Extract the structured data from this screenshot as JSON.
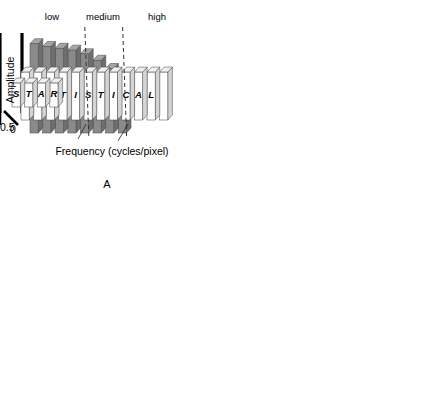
{
  "figure": {
    "axis": {
      "x_label": "Frequency (cycles/pixel)",
      "y_label": "Amplitude",
      "x_min_tick": "0",
      "x_max_tick": "0.5"
    },
    "bands": [
      {
        "label": "low"
      },
      {
        "label": "medium"
      },
      {
        "label": "high"
      }
    ],
    "colors": {
      "signal_bar": "#8a8a8a",
      "signal_bar_side": "#6e6e6e",
      "signal_bar_top": "#a5a5a5",
      "noise_bar": "#ffffff",
      "noise_bar_side": "#d5d5d5",
      "noise_bar_top": "#f0f0f0",
      "envelope": "#d9d9d9",
      "envelope_stroke": "#6f6f6f",
      "axis": "#000000"
    },
    "panels": [
      {
        "id": "A",
        "letter": "A",
        "annotation": "",
        "row_back_word": "SIGNAL",
        "row_mid_word": "STATISTICAL",
        "row_front_word": "STAR",
        "show_bands": true,
        "show_axis_titles": true
      },
      {
        "id": "B",
        "letter": "B",
        "annotation": "ramp filter",
        "row_back_word": "SIGNAL",
        "row_mid_word": "NOISE",
        "row_front_word": "",
        "show_bands": false,
        "show_axis_titles": false
      },
      {
        "id": "C",
        "letter": "C",
        "annotation": "low pass filter",
        "row_back_word": "SIGNAL",
        "row_mid_word": "NOISE",
        "row_front_word": "STAR",
        "show_bands": false,
        "show_axis_titles": false
      },
      {
        "id": "D",
        "letter": "D",
        "annotation": "combination filter",
        "row_back_word": "SIGNAL",
        "row_mid_word": "NOISE",
        "row_front_word": "",
        "show_bands": false,
        "show_axis_titles": false
      }
    ]
  },
  "chart_data": {
    "type": "bar",
    "xlabel": "Frequency (cycles/pixel)",
    "ylabel": "Amplitude",
    "xlim": [
      0,
      0.5
    ],
    "ylim": [
      0,
      1
    ],
    "grid": false,
    "legend": false,
    "n_bins": 12,
    "bin_labels": [
      "S",
      "T",
      "A",
      "T",
      "I",
      "S",
      "T",
      "I",
      "C",
      "A",
      "L",
      ""
    ],
    "bands": {
      "low": [
        0,
        0.17
      ],
      "medium": [
        0.17,
        0.29
      ],
      "high": [
        0.29,
        0.5
      ]
    },
    "panels": [
      {
        "id": "A",
        "annotation": "",
        "filter_shape": "none",
        "filter_gain": [
          1,
          1,
          1,
          1,
          1,
          1,
          1,
          1,
          1,
          1,
          1,
          1
        ],
        "series": [
          {
            "name": "SIGNAL",
            "letters": [
              "",
              "S",
              "I",
              "G",
              "N",
              "A",
              "L",
              "",
              "",
              "",
              "",
              ""
            ],
            "values": [
              0.97,
              0.94,
              0.92,
              0.9,
              0.86,
              0.79,
              0.7,
              0.56,
              0,
              0,
              0,
              0
            ]
          },
          {
            "name": "STATISTICAL",
            "letters": [
              "S",
              "T",
              "A",
              "T",
              "I",
              "S",
              "T",
              "I",
              "C",
              "A",
              "L",
              ""
            ],
            "values": [
              0.52,
              0.52,
              0.52,
              0.52,
              0.52,
              0.52,
              0.52,
              0.52,
              0.52,
              0.52,
              0.52,
              0.52
            ]
          },
          {
            "name": "STAR",
            "letters": [
              "S",
              "T",
              "A",
              "R",
              "",
              "",
              "",
              "",
              "",
              "",
              "",
              ""
            ],
            "values": [
              0.26,
              0.26,
              0.26,
              0.26,
              0,
              0,
              0,
              0,
              0,
              0,
              0,
              0
            ]
          }
        ]
      },
      {
        "id": "B",
        "annotation": "ramp filter",
        "filter_shape": "ramp",
        "filter_gain": [
          0.05,
          0.14,
          0.23,
          0.32,
          0.41,
          0.5,
          0.59,
          0.68,
          0.77,
          0.86,
          0.93,
          1.0
        ],
        "series": [
          {
            "name": "SIGNAL",
            "letters": [
              "",
              "S",
              "I",
              "G",
              "N",
              "A",
              "L",
              "",
              "",
              "",
              "",
              ""
            ],
            "values": [
              0.05,
              0.13,
              0.21,
              0.29,
              0.35,
              0.4,
              0.41,
              0.38,
              0,
              0,
              0,
              0
            ]
          },
          {
            "name": "NOISE",
            "letters": [
              "",
              "N",
              "O",
              "I",
              "S",
              "E",
              "",
              "",
              "",
              "",
              "",
              ""
            ],
            "values": [
              0.03,
              0.07,
              0.12,
              0.17,
              0.21,
              0.26,
              0.31,
              0.35,
              0.4,
              0.44,
              0.48,
              0.52
            ]
          },
          {
            "name": "STAR",
            "letters": [
              "",
              "",
              "",
              "",
              "",
              "",
              "",
              "",
              "",
              "",
              "",
              ""
            ],
            "values": [
              0,
              0,
              0,
              0,
              0,
              0,
              0,
              0,
              0,
              0,
              0,
              0
            ]
          }
        ]
      },
      {
        "id": "C",
        "annotation": "low pass filter",
        "filter_shape": "lowpass",
        "filter_gain": [
          1.0,
          1.0,
          1.0,
          1.0,
          1.0,
          1.0,
          0.88,
          0.74,
          0.6,
          0.45,
          0.3,
          0.16
        ],
        "series": [
          {
            "name": "SIGNAL",
            "letters": [
              "S",
              "I",
              "G",
              "M",
              "A",
              "L",
              "",
              "",
              "",
              "",
              "",
              ""
            ],
            "values": [
              0.97,
              0.94,
              0.92,
              0.9,
              0.86,
              0.79,
              0.62,
              0.47,
              0,
              0,
              0,
              0
            ]
          },
          {
            "name": "NOISE",
            "letters": [
              "",
              "",
              "N",
              "O",
              "I",
              "S",
              "E",
              "",
              "",
              "",
              "",
              ""
            ],
            "values": [
              0.52,
              0.52,
              0.52,
              0.52,
              0.52,
              0.52,
              0.5,
              0.42,
              0.34,
              0.26,
              0.19,
              0.12
            ]
          },
          {
            "name": "STAR",
            "letters": [
              "S",
              "T",
              "A",
              "R",
              "",
              "",
              "",
              "",
              "",
              "",
              "",
              ""
            ],
            "values": [
              0.26,
              0.26,
              0.26,
              0.26,
              0,
              0,
              0,
              0,
              0,
              0,
              0,
              0
            ]
          }
        ]
      },
      {
        "id": "D",
        "annotation": "combination filter",
        "filter_shape": "bandpass",
        "filter_gain": [
          0.06,
          0.2,
          0.38,
          0.58,
          0.78,
          0.93,
          1.0,
          0.96,
          0.8,
          0.55,
          0.28,
          0.08
        ],
        "series": [
          {
            "name": "SIGNAL",
            "letters": [
              "",
              "S",
              "I",
              "G",
              "N",
              "A",
              "L",
              "",
              "",
              "",
              "",
              ""
            ],
            "values": [
              0.06,
              0.19,
              0.35,
              0.52,
              0.67,
              0.73,
              0.7,
              0.54,
              0,
              0,
              0,
              0
            ]
          },
          {
            "name": "NOISE",
            "letters": [
              "",
              "N",
              "O",
              "I",
              "S",
              "E",
              "",
              "",
              "",
              "",
              "",
              ""
            ],
            "values": [
              0.03,
              0.1,
              0.2,
              0.3,
              0.4,
              0.48,
              0.52,
              0.5,
              0.41,
              0.28,
              0.15,
              0.05
            ]
          },
          {
            "name": "STAR",
            "letters": [
              "",
              "",
              "",
              "",
              "",
              "",
              "",
              "",
              "",
              "",
              "",
              ""
            ],
            "values": [
              0,
              0,
              0,
              0,
              0,
              0,
              0,
              0,
              0,
              0,
              0,
              0
            ]
          }
        ]
      }
    ]
  }
}
